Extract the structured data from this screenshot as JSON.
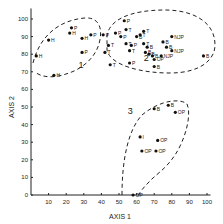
{
  "chart_data": {
    "type": "scatter",
    "title": "",
    "xlabel": "AXIS 1",
    "ylabel": "AXIS 2",
    "xlim": [
      0,
      100
    ],
    "ylim": [
      0,
      100
    ],
    "x_ticks": [
      10,
      20,
      30,
      40,
      50,
      60,
      70,
      80,
      90,
      100
    ],
    "y_ticks": [
      0,
      10,
      20,
      30,
      40,
      50,
      60,
      70,
      80,
      90,
      100
    ],
    "grid": false,
    "legend": null,
    "clusters": [
      {
        "label": "1",
        "label_pos": [
          27,
          72
        ]
      },
      {
        "label": "2",
        "label_pos": [
          64,
          76
        ]
      },
      {
        "label": "3",
        "label_pos": [
          55,
          46
        ]
      }
    ],
    "points": [
      {
        "x": 3,
        "y": 79,
        "label": "H",
        "cluster": 1
      },
      {
        "x": 10,
        "y": 88,
        "label": "H",
        "cluster": 1
      },
      {
        "x": 13,
        "y": 68,
        "label": "H",
        "cluster": 1
      },
      {
        "x": 22,
        "y": 92,
        "label": "H",
        "cluster": 1
      },
      {
        "x": 23,
        "y": 95,
        "label": "P",
        "cluster": 1
      },
      {
        "x": 29,
        "y": 89,
        "label": "H",
        "cluster": 1
      },
      {
        "x": 29,
        "y": 81,
        "label": "P",
        "cluster": 1
      },
      {
        "x": 34,
        "y": 91,
        "label": "P",
        "cluster": 1
      },
      {
        "x": 41,
        "y": 91,
        "label": "P",
        "cluster": 2
      },
      {
        "x": 44,
        "y": 85,
        "label": "T",
        "cluster": 2
      },
      {
        "x": 42,
        "y": 81,
        "label": "T",
        "cluster": 2
      },
      {
        "x": 45,
        "y": 74,
        "label": "T",
        "cluster": 2
      },
      {
        "x": 48,
        "y": 92,
        "label": "P",
        "cluster": 2
      },
      {
        "x": 51,
        "y": 90,
        "label": "P",
        "cluster": 2
      },
      {
        "x": 53,
        "y": 99,
        "label": "P",
        "cluster": 2
      },
      {
        "x": 54,
        "y": 94,
        "label": "T",
        "cluster": 2
      },
      {
        "x": 54,
        "y": 86,
        "label": "T",
        "cluster": 2
      },
      {
        "x": 56,
        "y": 82,
        "label": "T",
        "cluster": 2
      },
      {
        "x": 57,
        "y": 85,
        "label": "P",
        "cluster": 2
      },
      {
        "x": 56,
        "y": 75,
        "label": "P",
        "cluster": 2
      },
      {
        "x": 60,
        "y": 90,
        "label": "B",
        "cluster": 2
      },
      {
        "x": 62,
        "y": 91,
        "label": "T",
        "cluster": 2
      },
      {
        "x": 64,
        "y": 93,
        "label": "T",
        "cluster": 2
      },
      {
        "x": 64,
        "y": 86,
        "label": "T",
        "cluster": 2
      },
      {
        "x": 66,
        "y": 84,
        "label": "B",
        "cluster": 2
      },
      {
        "x": 65,
        "y": 81,
        "label": "B",
        "cluster": 2
      },
      {
        "x": 67,
        "y": 80,
        "label": "B",
        "cluster": 2
      },
      {
        "x": 69,
        "y": 79,
        "label": "B",
        "cluster": 2
      },
      {
        "x": 70,
        "y": 77,
        "label": "OP",
        "cluster": 2
      },
      {
        "x": 70,
        "y": 73,
        "label": "B",
        "cluster": 2
      },
      {
        "x": 74,
        "y": 79,
        "label": "NJP",
        "cluster": 2
      },
      {
        "x": 75,
        "y": 87,
        "label": "B",
        "cluster": 2
      },
      {
        "x": 77,
        "y": 84,
        "label": "B",
        "cluster": 2
      },
      {
        "x": 80,
        "y": 90,
        "label": "NJP",
        "cluster": 2
      },
      {
        "x": 80,
        "y": 82,
        "label": "NJP",
        "cluster": 2
      },
      {
        "x": 98,
        "y": 79,
        "label": "B",
        "cluster": 2
      },
      {
        "x": 70,
        "y": 49,
        "label": "B",
        "cluster": 3
      },
      {
        "x": 78,
        "y": 51,
        "label": "B",
        "cluster": 3
      },
      {
        "x": 82,
        "y": 47,
        "label": "OP",
        "cluster": 3
      },
      {
        "x": 62,
        "y": 33,
        "label": "I",
        "cluster": 3
      },
      {
        "x": 72,
        "y": 31,
        "label": "OP",
        "cluster": 3
      },
      {
        "x": 63,
        "y": 25,
        "label": "OP",
        "cluster": 3
      },
      {
        "x": 71,
        "y": 25,
        "label": "OP",
        "cluster": 3
      },
      {
        "x": 58,
        "y": 0,
        "label": "OP",
        "cluster": 3
      }
    ]
  }
}
